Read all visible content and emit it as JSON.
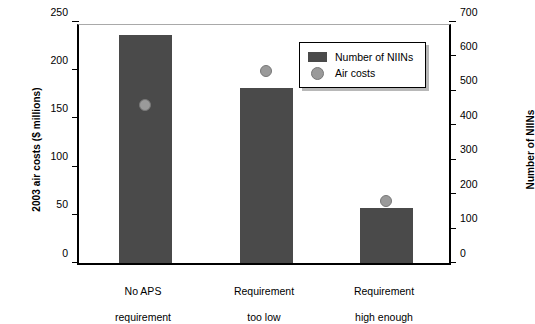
{
  "chart_data": {
    "type": "bar",
    "title": "",
    "subtitle": "",
    "categories": [
      "No APS\nrequirement",
      "Requirement\ntoo low",
      "Requirement\nhigh enough"
    ],
    "series": [
      {
        "name": "Number of NIINs",
        "type": "bar",
        "axis": "right",
        "values": [
          663,
          508,
          161
        ],
        "color": "#4a4a4a"
      },
      {
        "name": "Air costs",
        "type": "scatter",
        "axis": "left",
        "values": [
          164,
          199,
          64
        ],
        "color": "#9a9a9a"
      }
    ],
    "ylabel": "2003 air costs ($ millions)",
    "ylim": [
      0,
      250
    ],
    "yticks": [
      0,
      50,
      100,
      150,
      200,
      250
    ],
    "y2label": "Number of NIINs",
    "y2lim": [
      0,
      700
    ],
    "y2ticks": [
      0,
      100,
      200,
      300,
      400,
      500,
      600,
      700
    ],
    "xlabel": "",
    "grid": false,
    "legend_position": "top-right"
  },
  "axes": {
    "left_title": "2003 air costs ($ millions)",
    "right_title": "Number of NIINs",
    "left_ticks": [
      "0",
      "50",
      "100",
      "150",
      "200",
      "250"
    ],
    "right_ticks": [
      "0",
      "100",
      "200",
      "300",
      "400",
      "500",
      "600",
      "700"
    ]
  },
  "categories": [
    {
      "line1": "No APS",
      "line2": "requirement"
    },
    {
      "line1": "Requirement",
      "line2": "too low"
    },
    {
      "line1": "Requirement",
      "line2": "high enough"
    }
  ],
  "legend": {
    "items": [
      {
        "label": "Number of NIINs",
        "marker": "bar-swatch"
      },
      {
        "label": "Air costs",
        "marker": "circle-swatch"
      }
    ]
  }
}
